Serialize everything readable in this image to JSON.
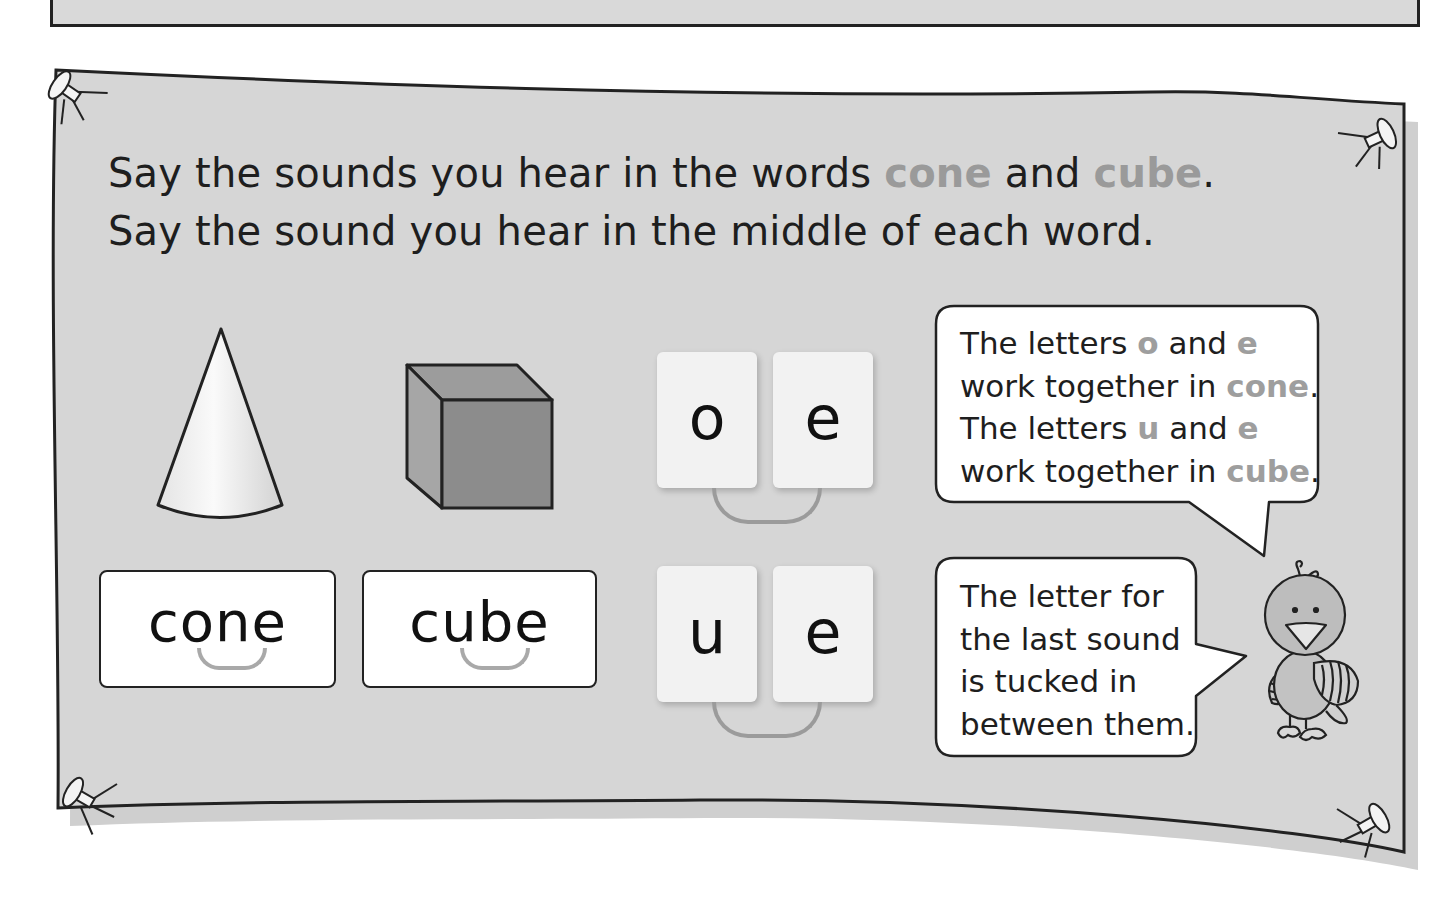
{
  "page": {
    "colors": {
      "board_fill": "#d6d6d6",
      "board_outline": "#222222",
      "highlight_text": "#9a9a9a",
      "body_text": "#1e1e1e",
      "card_fill": "#ffffff",
      "tile_fill": "#f2f2f2",
      "join_line": "#9b9b9b"
    }
  },
  "board": {
    "instruction": {
      "line1": {
        "before": "Say the sounds you hear in the words ",
        "word1": "cone",
        "middle": " and ",
        "word2": "cube",
        "end": "."
      },
      "line2": "Say the sound you hear in the middle of each word."
    },
    "pictures": [
      {
        "name": "cone",
        "icon": "cone-shape-icon"
      },
      {
        "name": "cube",
        "icon": "cube-shape-icon"
      }
    ],
    "word_cards": [
      {
        "word": "cone",
        "joined_letters": "o_e"
      },
      {
        "word": "cube",
        "joined_letters": "u_e"
      }
    ],
    "letter_tiles": [
      {
        "pair": [
          "o",
          "e"
        ]
      },
      {
        "pair": [
          "u",
          "e"
        ]
      }
    ],
    "speech_bubbles": [
      {
        "lines": [
          {
            "t1": "The letters ",
            "h1": "o",
            "t2": " and ",
            "h2": "e"
          },
          {
            "t1": "work together in ",
            "h1": "cone",
            "t2": ".",
            "h2": ""
          },
          {
            "t1": "The letters ",
            "h1": "u",
            "t2": " and ",
            "h2": "e"
          },
          {
            "t1": "work together in ",
            "h1": "cube",
            "t2": ".",
            "h2": ""
          }
        ]
      },
      {
        "lines": [
          "The letter for",
          "the last sound",
          "is tucked in",
          "between them."
        ]
      }
    ],
    "mascot": {
      "icon": "bird-mascot-icon"
    }
  }
}
